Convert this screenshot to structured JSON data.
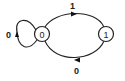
{
  "diagram": {
    "type": "state-machine",
    "states": [
      {
        "id": "s0",
        "label": "0"
      },
      {
        "id": "s1",
        "label": "1"
      }
    ],
    "transitions": [
      {
        "from": "0",
        "to": "0",
        "label": "0"
      },
      {
        "from": "0",
        "to": "1",
        "label": "1"
      },
      {
        "from": "1",
        "to": "0",
        "label": "0"
      }
    ],
    "colors": {
      "stroke": "#222222",
      "background": "#ffffff"
    }
  }
}
